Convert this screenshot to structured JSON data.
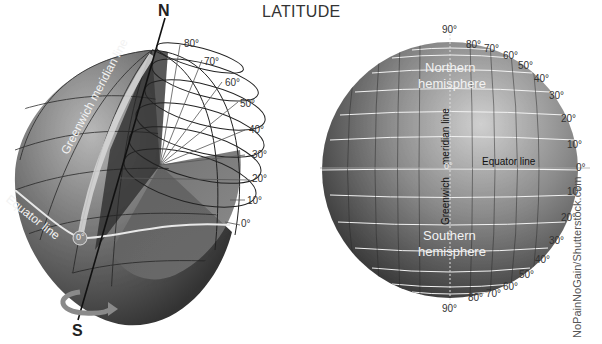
{
  "title": "LATITUDE",
  "left_globe": {
    "north_label": "N",
    "south_label": "S",
    "greenwich_label": "Greenwich meridian line",
    "equator_label": "Equator line",
    "origin_label": "0°",
    "latitude_ticks": [
      "80°",
      "70°",
      "60°",
      "50°",
      "40°",
      "30°",
      "20°",
      "10°",
      "0°"
    ]
  },
  "right_globe": {
    "north_pole_label": "90°",
    "south_pole_label": "90°",
    "northern_label_line1": "Northern",
    "northern_label_line2": "hemisphere",
    "southern_label_line1": "Southern",
    "southern_label_line2": "hemisphere",
    "meridian_label_top": "meridian line",
    "meridian_label_bottom": "Greenwich",
    "equator_label": "Equator line",
    "center_label": "0°",
    "equator_tick": "0°",
    "north_ticks": [
      "80°",
      "70°",
      "60°",
      "50°",
      "40°",
      "30°",
      "20°",
      "10°"
    ],
    "south_ticks": [
      "10°",
      "20°",
      "30°",
      "40°",
      "50°",
      "60°",
      "70°",
      "80°"
    ]
  },
  "credit": "NoPainNoGain/Shutterstock.com",
  "colors": {
    "globe_dark": "#3a3a3a",
    "globe_mid": "#6e6e6e",
    "globe_light": "#b5b5b5",
    "grid_white": "#f0f0f0",
    "arrow": "#8a8a8a"
  }
}
